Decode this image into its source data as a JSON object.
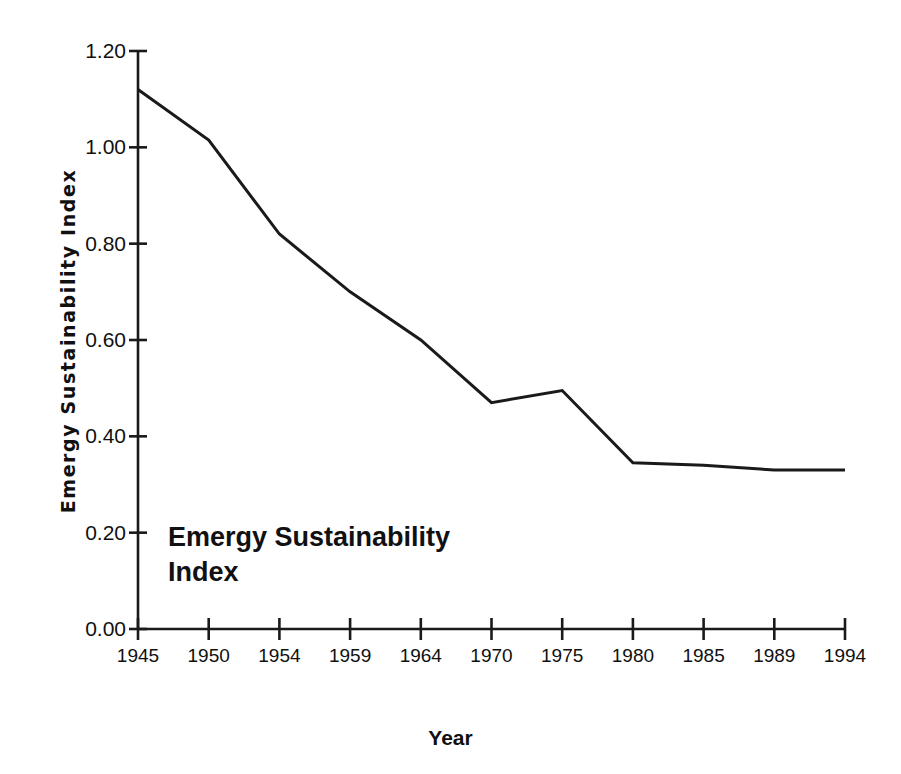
{
  "chart_data": {
    "type": "line",
    "title": "",
    "xlabel": "Year",
    "ylabel": "Emergy Sustainability Index",
    "annotation": "Emergy Sustainability\nIndex",
    "grid": false,
    "legend": "none",
    "line_color": "#1a1a1a",
    "axis_color": "#1a1a1a",
    "background_color": "#ffffff",
    "xlim": [
      1945,
      1994
    ],
    "ylim": [
      0.0,
      1.2
    ],
    "x_tick_labels": [
      "1945",
      "1950",
      "1954",
      "1959",
      "1964",
      "1970",
      "1975",
      "1980",
      "1985",
      "1989",
      "1994"
    ],
    "y_tick_labels": [
      "0.00",
      "0.20",
      "0.40",
      "0.60",
      "0.80",
      "1.00",
      "1.20"
    ],
    "y_ticks": [
      0.0,
      0.2,
      0.4,
      0.6,
      0.8,
      1.0,
      1.2
    ],
    "categories": [
      1945,
      1950,
      1954,
      1959,
      1964,
      1970,
      1975,
      1980,
      1985,
      1989,
      1994
    ],
    "series": [
      {
        "name": "Emergy Sustainability Index",
        "values": [
          1.12,
          1.015,
          0.82,
          0.7,
          0.6,
          0.47,
          0.495,
          0.345,
          0.34,
          0.33,
          0.33
        ]
      }
    ]
  }
}
